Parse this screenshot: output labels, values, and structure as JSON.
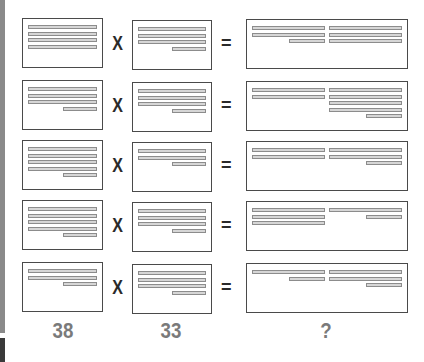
{
  "colors": {
    "box_border": "#4a4a4a",
    "line_fill": "#d6d6d6",
    "line_border": "#8c8c8c",
    "label": "#7a7a7a",
    "operator": "#2a2a2a"
  },
  "operators": {
    "multiply": "X",
    "equals": "="
  },
  "labels": {
    "col1": "38",
    "col2": "33",
    "col3": "?"
  },
  "rows": [
    {
      "a": [
        [
          0,
          100
        ],
        [
          0,
          100
        ],
        [
          0,
          100
        ],
        [
          0,
          100
        ]
      ],
      "b": [
        [
          0,
          100
        ],
        [
          0,
          100
        ],
        [
          0,
          100
        ],
        [
          50,
          100
        ]
      ],
      "result_left": [
        [
          0,
          100
        ],
        [
          0,
          100
        ],
        [
          50,
          100
        ]
      ],
      "result_right": [
        [
          0,
          100
        ],
        [
          0,
          100
        ],
        [
          0,
          100
        ]
      ]
    },
    {
      "a": [
        [
          0,
          100
        ],
        [
          0,
          100
        ],
        [
          0,
          100
        ],
        [
          50,
          100
        ]
      ],
      "b": [
        [
          0,
          100
        ],
        [
          0,
          100
        ],
        [
          0,
          100
        ],
        [
          50,
          100
        ]
      ],
      "result_left": [
        [
          0,
          100
        ],
        [
          0,
          100
        ]
      ],
      "result_right": [
        [
          0,
          100
        ],
        [
          0,
          100
        ],
        [
          0,
          100
        ],
        [
          0,
          100
        ],
        [
          50,
          100
        ]
      ]
    },
    {
      "a": [
        [
          0,
          100
        ],
        [
          0,
          100
        ],
        [
          0,
          100
        ],
        [
          0,
          100
        ],
        [
          50,
          100
        ]
      ],
      "b": [
        [
          0,
          100
        ],
        [
          0,
          100
        ],
        [
          50,
          100
        ]
      ],
      "result_left": [
        [
          0,
          100
        ],
        [
          0,
          100
        ]
      ],
      "result_right": [
        [
          0,
          100
        ],
        [
          0,
          100
        ],
        [
          50,
          100
        ]
      ]
    },
    {
      "a": [
        [
          0,
          100
        ],
        [
          0,
          100
        ],
        [
          0,
          100
        ],
        [
          0,
          100
        ],
        [
          50,
          100
        ]
      ],
      "b": [
        [
          0,
          100
        ],
        [
          0,
          100
        ],
        [
          0,
          100
        ],
        [
          50,
          100
        ]
      ],
      "result_left": [
        [
          0,
          100
        ],
        [
          0,
          100
        ],
        [
          0,
          100
        ]
      ],
      "result_right": [
        [
          0,
          100
        ],
        [
          50,
          100
        ]
      ]
    },
    {
      "a": [
        [
          0,
          100
        ],
        [
          0,
          100
        ],
        [
          50,
          100
        ]
      ],
      "b": [
        [
          0,
          100
        ],
        [
          0,
          100
        ],
        [
          0,
          100
        ],
        [
          50,
          100
        ]
      ],
      "result_left": [
        [
          0,
          100
        ],
        [
          50,
          100
        ]
      ],
      "result_right": [
        [
          0,
          100
        ],
        [
          0,
          100
        ],
        [
          50,
          100
        ]
      ]
    }
  ]
}
